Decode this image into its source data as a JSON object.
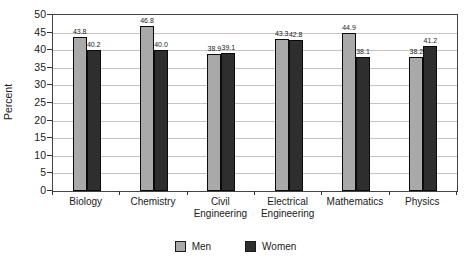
{
  "chart_data": {
    "type": "bar",
    "title": "",
    "xlabel": "",
    "ylabel": "Percent",
    "ylim": [
      0,
      50
    ],
    "ytick_step": 5,
    "grid": true,
    "legend_position": "bottom",
    "categories": [
      "Biology",
      "Chemistry",
      "Civil Engineering",
      "Electrical Engineering",
      "Mathematics",
      "Physics"
    ],
    "series": [
      {
        "name": "Men",
        "color": "#a9a9a9",
        "values": [
          43.8,
          46.8,
          38.9,
          43.3,
          44.9,
          38.2
        ]
      },
      {
        "name": "Women",
        "color": "#2e2e2e",
        "values": [
          40.2,
          40.0,
          39.1,
          42.8,
          38.1,
          41.2
        ]
      }
    ],
    "value_label_decimals": 1,
    "colors": {
      "bar_border": "#0a0a0a",
      "gridline": "#c3c3c3",
      "axis": "#444444",
      "text": "#1a1a1a"
    }
  }
}
